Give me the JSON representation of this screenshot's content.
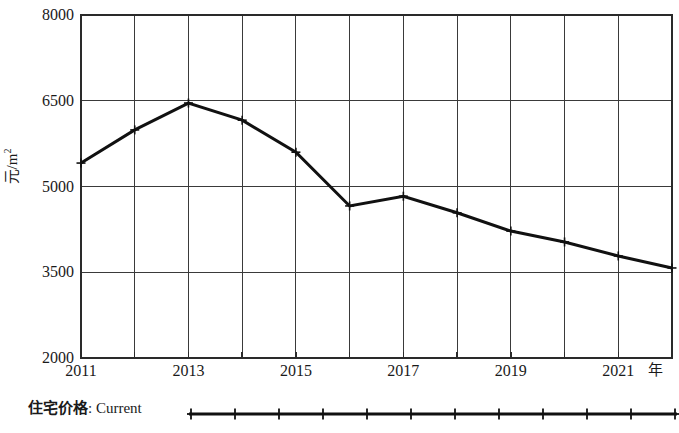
{
  "chart_data": {
    "type": "line",
    "title": "",
    "subtitle": "",
    "xlabel": "年",
    "ylabel": "元/m²",
    "x": [
      2011,
      2012,
      2013,
      2014,
      2015,
      2016,
      2017,
      2018,
      2019,
      2020,
      2021,
      2022
    ],
    "xtick_labels": [
      "2011",
      "2013",
      "2015",
      "2017",
      "2019",
      "2021"
    ],
    "xtick_values": [
      2011,
      2013,
      2015,
      2017,
      2019,
      2021
    ],
    "ytick_labels": [
      "8000",
      "6500",
      "5000",
      "3500",
      "2000"
    ],
    "ytick_values": [
      8000,
      6500,
      5000,
      3500,
      2000
    ],
    "xlim": [
      2011,
      2022
    ],
    "ylim": [
      2000,
      8000
    ],
    "grid": true,
    "legend_position": "below-axes-left",
    "series": [
      {
        "name": "住宅价格: Current",
        "color": "#111111",
        "marker": "plus",
        "values": [
          5410,
          5990,
          6460,
          6160,
          5600,
          4660,
          4830,
          4540,
          4220,
          4030,
          3785,
          3575
        ]
      }
    ],
    "legend": [
      {
        "label_cn": "住宅价格",
        "label_sep": ": ",
        "label_en": "Current",
        "marker": "plus",
        "color": "#111111",
        "sample_markers": 12
      }
    ],
    "annotations": []
  },
  "axes": {
    "y_label_main": "元/m",
    "y_label_sup": "2",
    "x_unit": "年"
  }
}
